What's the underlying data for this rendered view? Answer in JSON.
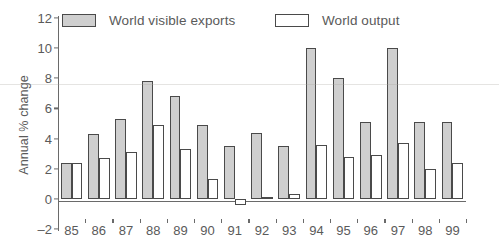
{
  "chart_data": {
    "type": "bar",
    "title": "",
    "subtitle": "",
    "xlabel": "",
    "ylabel": "Annual % change",
    "categories": [
      "85",
      "86",
      "87",
      "88",
      "89",
      "90",
      "91",
      "92",
      "93",
      "94",
      "95",
      "96",
      "97",
      "98",
      "99"
    ],
    "series": [
      {
        "name": "World visible exports",
        "color": "#cfcfcf",
        "values": [
          2.4,
          4.3,
          5.3,
          7.8,
          6.8,
          4.9,
          3.5,
          4.4,
          3.5,
          10.0,
          8.0,
          5.1,
          10.0,
          5.1,
          5.1
        ]
      },
      {
        "name": "World output",
        "color": "#ffffff",
        "values": [
          2.4,
          2.7,
          3.1,
          4.9,
          3.3,
          1.3,
          -0.4,
          0.1,
          0.3,
          3.6,
          2.8,
          2.9,
          3.7,
          2.0,
          2.4
        ]
      }
    ],
    "ylim": [
      -2,
      12
    ],
    "yticks": [
      12,
      10,
      8,
      6,
      4,
      2,
      0,
      -2
    ],
    "ytick_labels": [
      "12",
      "10",
      "8",
      "6",
      "4",
      "2",
      "0",
      "–2"
    ],
    "grid": false,
    "legend_position": "top",
    "legend": [
      {
        "label": "World visible exports",
        "swatch": "fill-gray"
      },
      {
        "label": "World output",
        "swatch": "fill-white"
      }
    ]
  }
}
